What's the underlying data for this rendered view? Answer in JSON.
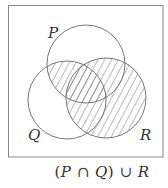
{
  "diagram": {
    "type": "venn",
    "frame": {
      "x": 8,
      "y": 5,
      "width": 155,
      "height": 152,
      "stroke": "#888888"
    },
    "sets": [
      {
        "name": "P",
        "label": "P",
        "cx": 86,
        "cy": 64,
        "r": 39,
        "label_x": 49,
        "label_y": 38
      },
      {
        "name": "Q",
        "label": "Q",
        "cx": 67,
        "cy": 100,
        "r": 39,
        "label_x": 29,
        "label_y": 140
      },
      {
        "name": "R",
        "label": "R",
        "cx": 106,
        "cy": 98,
        "r": 40,
        "label_x": 141,
        "label_y": 140
      }
    ],
    "shaded_region": "(P ∩ Q) ∪ R",
    "hatch": {
      "style": "diagonal",
      "spacing": 6,
      "color": "#555555"
    },
    "stroke_color": "#777777"
  },
  "caption": {
    "open_paren": "(",
    "p": "P",
    "intersect": " ∩ ",
    "q": "Q",
    "close_paren": ")",
    "union": " ∪ ",
    "r": "R",
    "full_text": "(P ∩ Q) ∪ R"
  }
}
